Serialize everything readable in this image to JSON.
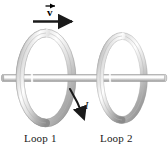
{
  "figure": {
    "background_color": "#ffffff"
  },
  "labels": {
    "loop1": "Loop 1",
    "loop2": "Loop 2",
    "velocity_symbol": "v",
    "current_symbol": "I"
  },
  "annotations": {
    "velocity_arrow": {
      "name": "velocity-arrow",
      "direction": "right",
      "color": "#1a1a1a"
    },
    "current_arrow": {
      "name": "current-arrow",
      "direction": "down-left-curved",
      "color": "#1a1a1a"
    }
  },
  "colors": {
    "ring_light": "#ffffff",
    "ring_mid": "#c9c9c9",
    "ring_dark": "#8e8e8e",
    "rod_light": "#f2f2f2",
    "rod_mid": "#c4c4c4",
    "rod_dark": "#9a9a9a",
    "text": "#1a1a1a",
    "arrow": "#1a1a1a"
  },
  "geometry": {
    "loop1": {
      "cx": 46,
      "cy": 78,
      "rx": 26,
      "ry": 45
    },
    "loop2": {
      "cx": 122,
      "cy": 78,
      "rx": 22,
      "ry": 42
    },
    "rod": {
      "x1": 2,
      "x2": 166,
      "y": 78,
      "thickness": 7
    }
  }
}
